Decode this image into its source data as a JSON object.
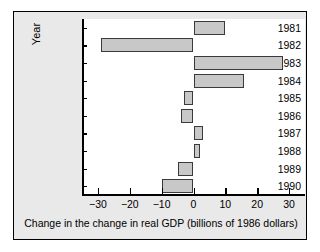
{
  "chart_data": {
    "type": "bar",
    "orientation": "horizontal",
    "title": "",
    "xlabel": "Change in the change in real GDP (billions of 1986 dollars)",
    "ylabel": "Year",
    "categories": [
      "1981",
      "1982",
      "1983",
      "1984",
      "1985",
      "1986",
      "1987",
      "1988",
      "1989",
      "1990"
    ],
    "values": [
      10,
      -29,
      28,
      16,
      -3,
      -4,
      3,
      2,
      -5,
      -10
    ],
    "xlim": [
      -35,
      35
    ],
    "xticks": [
      -30,
      -20,
      -10,
      0,
      10,
      20,
      30
    ],
    "xtick_labels": [
      "−30",
      "−20",
      "−10",
      "0",
      "10",
      "20",
      "30"
    ],
    "grid": false,
    "legend": false,
    "bar_fill_color": "#c8c8c8",
    "bar_edge_color": "#3a3a3a",
    "panel_background": "#e9e9e9",
    "plot_background": "#ffffff",
    "axis_color": "#000000"
  }
}
